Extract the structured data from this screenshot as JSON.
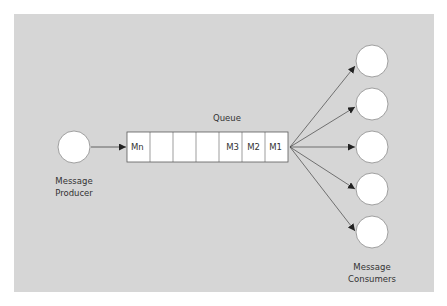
{
  "diagram": {
    "background_color": "#d6d6d6",
    "node_fill": "#ffffff",
    "stroke_color": "#5a5a5a",
    "text_color": "#333333",
    "producer": {
      "label_line1": "Message",
      "label_line2": "Producer"
    },
    "queue": {
      "title": "Queue",
      "cells": [
        "Mn",
        "",
        "",
        "",
        "M3",
        "M2",
        "M1"
      ]
    },
    "consumers": {
      "label_line1": "Message",
      "label_line2": "Consumers",
      "count": 5
    }
  }
}
